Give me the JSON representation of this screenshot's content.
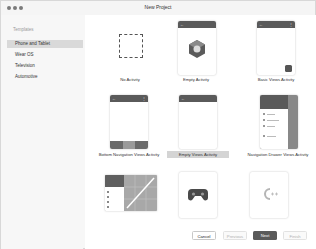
{
  "window": {
    "title": "New Project"
  },
  "sidebar": {
    "header": "Templates",
    "items": [
      {
        "label": "Phone and Tablet",
        "selected": true
      },
      {
        "label": "Wear OS",
        "selected": false
      },
      {
        "label": "Television",
        "selected": false
      },
      {
        "label": "Automotive",
        "selected": false
      }
    ]
  },
  "templates": [
    {
      "label": "No Activity"
    },
    {
      "label": "Empty Activity"
    },
    {
      "label": "Basic Views Activity"
    },
    {
      "label": "Bottom Navigation Views Activity"
    },
    {
      "label": "Empty Views Activity",
      "selected": true
    },
    {
      "label": "Navigation Drawer Views Activity"
    },
    {
      "label": "Responsive Views Activity"
    },
    {
      "label": "Game Activity"
    },
    {
      "label": "Native C++"
    }
  ],
  "icons": {
    "back": "←",
    "menu": "⋮"
  },
  "buttons": {
    "cancel": "Cancel",
    "previous": "Previous",
    "next": "Next",
    "finish": "Finish"
  },
  "colors": {
    "primary_button": "#5a5a5a",
    "selected_bg": "#d9d9d9",
    "appbar": "#5a5a5a"
  }
}
